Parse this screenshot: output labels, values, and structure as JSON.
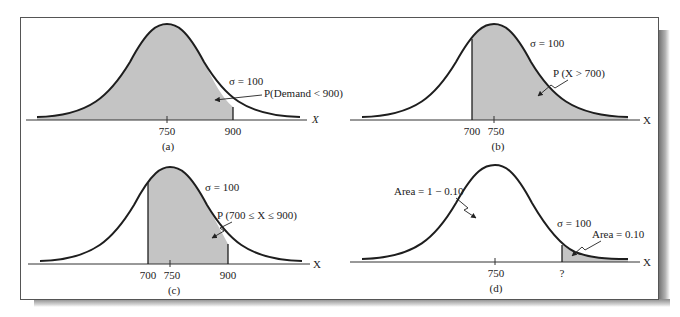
{
  "figure": {
    "panels": [
      {
        "id": "a",
        "caption": "(a)",
        "sigma_label": "σ = 100",
        "annotation": "P(Demand < 900)",
        "tick_labels": [
          "750",
          "900"
        ],
        "axis_label": "X",
        "shaded_region": "left of 900"
      },
      {
        "id": "b",
        "caption": "(b)",
        "sigma_label": "σ = 100",
        "annotation": "P (X > 700)",
        "tick_labels": [
          "700",
          "750"
        ],
        "axis_label": "X",
        "shaded_region": "right of 700"
      },
      {
        "id": "c",
        "caption": "(c)",
        "sigma_label": "σ = 100",
        "annotation": "P (700 ≤ X ≤ 900)",
        "tick_labels": [
          "700",
          "750",
          "900"
        ],
        "axis_label": "X",
        "shaded_region": "between 700 and 900"
      },
      {
        "id": "d",
        "caption": "(d)",
        "sigma_label": "σ = 100",
        "annotation_unshaded": "Area = 1 − 0.10",
        "annotation_shaded": "Area = 0.10",
        "tick_labels": [
          "750",
          "?"
        ],
        "axis_label": "X",
        "shaded_region": "right tail beyond ?"
      }
    ],
    "colors": {
      "shade": "#c4c4c4",
      "curve": "#1e1e1e",
      "axis": "#333333"
    }
  }
}
